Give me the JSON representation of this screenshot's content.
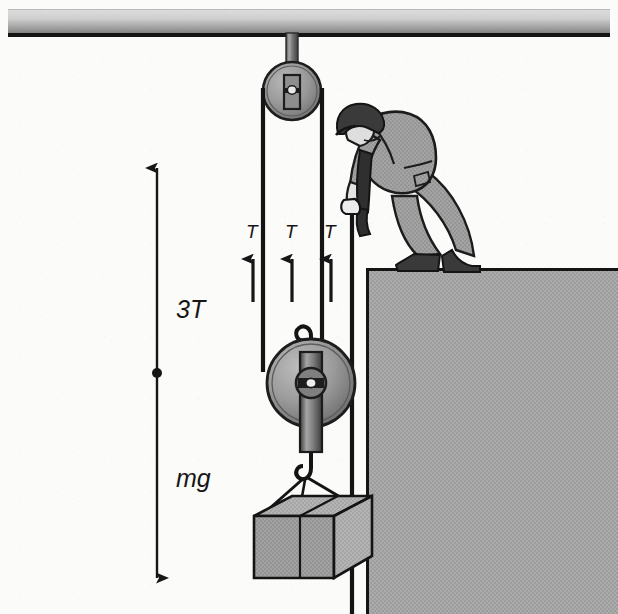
{
  "figure": {
    "kind": "physics-free-body-pulley-diagram",
    "title": ""
  },
  "labels": {
    "tension_1": "T",
    "tension_2": "T",
    "tension_3": "T",
    "net_up": "3T",
    "weight": "mg"
  },
  "force_vectors": [
    {
      "name": "tension-arrow-1",
      "label": "T",
      "direction": "up",
      "x": 253,
      "tip_y": 259,
      "tail_y": 302,
      "label_x": 246,
      "label_y": 231
    },
    {
      "name": "tension-arrow-2",
      "label": "T",
      "direction": "up",
      "x": 292,
      "tip_y": 259,
      "tail_y": 302,
      "label_x": 285,
      "label_y": 231
    },
    {
      "name": "tension-arrow-3",
      "label": "T",
      "direction": "up",
      "x": 331,
      "tip_y": 259,
      "tail_y": 302,
      "label_x": 324,
      "label_y": 231
    },
    {
      "name": "resultant-up-arrow",
      "label": "3T",
      "direction": "up",
      "x": 157,
      "tip_y": 168,
      "tail_y": 373,
      "label_x": 176,
      "label_y": 300
    },
    {
      "name": "weight-down-arrow",
      "label": "mg",
      "direction": "down",
      "x": 157,
      "tip_y": 578,
      "tail_y": 373,
      "label_x": 176,
      "label_y": 470
    }
  ],
  "colors": {
    "background": "#fbfbfa",
    "ink": "#161616",
    "mid_gray": "#9a9a9a",
    "light_gray": "#c2c2c2",
    "dark_gray": "#6b6b6b",
    "beam_light": "#d6d6d6",
    "beam_dark": "#8b8b8b",
    "wall_fill": "#a8a8a8",
    "crate_fill": "#b0b0b0",
    "worker_fill": "#9d9d9d",
    "hat_fill": "#3a3a3a"
  },
  "scene": {
    "ceiling_beam": {
      "name": "ceiling-beam",
      "x": 8,
      "y": 8,
      "width": 602,
      "height": 28
    },
    "hanger_rod": {
      "name": "pulley-hanger-rod",
      "x": 287,
      "y": 34,
      "width": 11,
      "height": 50
    },
    "fixed_pulley": {
      "name": "fixed-pulley",
      "cx": 292,
      "cy": 91,
      "r": 29
    },
    "movable_pulley": {
      "name": "movable-pulley",
      "cx": 311,
      "cy": 383,
      "r": 44
    },
    "pulley_hook": {
      "name": "movable-pulley-hook",
      "cx": 311,
      "cy": 325
    },
    "crate": {
      "name": "suspended-crate",
      "x": 254,
      "y": 500,
      "width": 118,
      "height": 78
    },
    "ledge": {
      "name": "ledge-platform",
      "x": 366,
      "y": 268,
      "width": 252,
      "height": 346
    },
    "worker": {
      "name": "worker-figure",
      "x": 330,
      "y": 104,
      "width": 150,
      "height": 168
    },
    "ropes": [
      {
        "name": "rope-left-segment",
        "x": 262,
        "from_y": 91,
        "to_y": 383
      },
      {
        "name": "rope-middle-segment",
        "x": 322,
        "from_y": 91,
        "to_y": 383
      },
      {
        "name": "rope-pull-segment",
        "x": 352,
        "from_y": 206,
        "to_y": 614
      }
    ]
  }
}
